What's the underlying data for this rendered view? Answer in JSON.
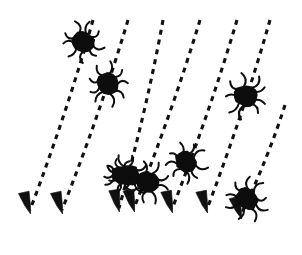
{
  "figure": {
    "background_color": "#ffffff",
    "ink_color": "#111111",
    "width": 302,
    "height": 255,
    "trajectory_count": 7,
    "tick_count": 8,
    "style": "hand-drawn black-and-white line art"
  },
  "trajectories": [
    {
      "id": "trajectory-1",
      "x1": 93,
      "y1": 20,
      "x2": 30,
      "y2": 210,
      "tip_x": 30,
      "tip_y": 212,
      "tip_angle": -17,
      "dash": "5 5"
    },
    {
      "id": "trajectory-2",
      "x1": 128,
      "y1": 20,
      "x2": 62,
      "y2": 210,
      "tip_x": 62,
      "tip_y": 212,
      "tip_angle": -17,
      "dash": "5 5"
    },
    {
      "id": "trajectory-3",
      "x1": 163,
      "y1": 20,
      "x2": 119,
      "y2": 208,
      "tip_x": 119,
      "tip_y": 210,
      "tip_angle": -13,
      "dash": "5 5"
    },
    {
      "id": "trajectory-4",
      "x1": 200,
      "y1": 20,
      "x2": 134,
      "y2": 208,
      "tip_x": 134,
      "tip_y": 210,
      "tip_angle": -15,
      "dash": "5 5"
    },
    {
      "id": "trajectory-5",
      "x1": 237,
      "y1": 20,
      "x2": 172,
      "y2": 209,
      "tip_x": 172,
      "tip_y": 211,
      "tip_angle": -16,
      "dash": "5 5"
    },
    {
      "id": "trajectory-6",
      "x1": 270,
      "y1": 20,
      "x2": 207,
      "y2": 209,
      "tip_x": 207,
      "tip_y": 211,
      "tip_angle": -16,
      "dash": "5 5"
    },
    {
      "id": "trajectory-7",
      "x1": 285,
      "y1": 105,
      "x2": 241,
      "y2": 215,
      "tip_x": 241,
      "tip_y": 217,
      "tip_angle": -18,
      "dash": "5 5"
    }
  ],
  "ticks": [
    {
      "id": "tick-1",
      "cx": 83,
      "cy": 42,
      "r": 11.5,
      "rotation": 12,
      "on_trajectory": "trajectory-1"
    },
    {
      "id": "tick-2",
      "cx": 108,
      "cy": 84,
      "r": 12.0,
      "rotation": 40,
      "on_trajectory": "trajectory-2"
    },
    {
      "id": "tick-3",
      "cx": 128,
      "cy": 175,
      "r": 12.0,
      "rotation": 5,
      "on_trajectory": "trajectory-3"
    },
    {
      "id": "tick-4",
      "cx": 148,
      "cy": 182,
      "r": 12.0,
      "rotation": 25,
      "on_trajectory": "trajectory-4"
    },
    {
      "id": "tick-5",
      "cx": 186,
      "cy": 162,
      "r": 11.5,
      "rotation": 50,
      "on_trajectory": "trajectory-5"
    },
    {
      "id": "tick-6",
      "cx": 246,
      "cy": 96,
      "r": 12.0,
      "rotation": 18,
      "on_trajectory": "trajectory-6"
    },
    {
      "id": "tick-7",
      "cx": 247,
      "cy": 199,
      "r": 12.0,
      "rotation": 33,
      "on_trajectory": "trajectory-7"
    },
    {
      "id": "tick-8",
      "cx": 120,
      "cy": 175,
      "r": 9.5,
      "rotation": 60,
      "on_trajectory": "trajectory-3"
    }
  ]
}
